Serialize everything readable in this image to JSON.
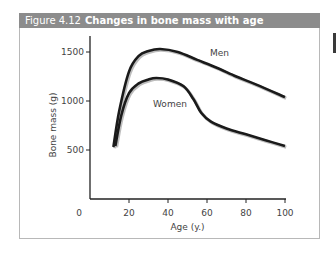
{
  "figure": {
    "number": "Figure 4.12",
    "title": "Changes in bone mass with age",
    "header_color": "#8c8c8c"
  },
  "chart_data": {
    "type": "line",
    "title": "Changes in bone mass with age",
    "xlabel": "Age (y.)",
    "ylabel": "Bone mass (g)",
    "xlim": [
      0,
      100
    ],
    "ylim": [
      0,
      1650
    ],
    "x_ticks": [
      0,
      20,
      40,
      60,
      80,
      100
    ],
    "y_ticks": [
      500,
      1000,
      1500
    ],
    "grid": false,
    "legend": "inline labels",
    "series": [
      {
        "name": "Men",
        "x": [
          12,
          15,
          20,
          25,
          30,
          36,
          45,
          55,
          65,
          75,
          85,
          100
        ],
        "values": [
          530,
          900,
          1300,
          1460,
          1510,
          1530,
          1500,
          1420,
          1340,
          1250,
          1170,
          1040
        ]
      },
      {
        "name": "Women",
        "x": [
          13,
          16,
          20,
          25,
          30,
          34,
          40,
          48,
          53,
          57,
          62,
          70,
          80,
          90,
          100
        ],
        "values": [
          540,
          850,
          1080,
          1180,
          1220,
          1235,
          1220,
          1150,
          1020,
          880,
          790,
          720,
          660,
          600,
          540
        ]
      }
    ]
  }
}
